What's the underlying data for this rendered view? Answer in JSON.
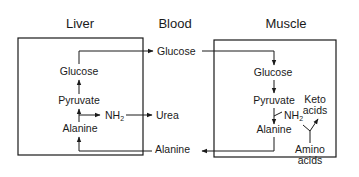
{
  "diagram": {
    "type": "glucose-alanine cycle",
    "compartments": [
      {
        "id": "liver",
        "title": "Liver"
      },
      {
        "id": "blood",
        "title": "Blood"
      },
      {
        "id": "muscle",
        "title": "Muscle"
      }
    ],
    "liver": {
      "glucose": "Glucose",
      "pyruvate": "Pyruvate",
      "alanine": "Alanine",
      "nh2": "NH",
      "nh2_sub": "2"
    },
    "blood": {
      "glucose": "Glucose",
      "urea": "Urea",
      "alanine": "Alanine"
    },
    "muscle": {
      "glucose": "Glucose",
      "pyruvate": "Pyruvate",
      "alanine": "Alanine",
      "nh2": "NH",
      "nh2_sub": "2",
      "keto1": "Keto",
      "keto2": "acids",
      "amino1": "Amino",
      "amino2": "acids"
    },
    "edges": [
      {
        "from": "Liver Alanine",
        "to": "Liver Pyruvate"
      },
      {
        "from": "Liver Pyruvate",
        "to": "Liver Glucose"
      },
      {
        "from": "Liver Glucose",
        "to": "Blood Glucose"
      },
      {
        "from": "Blood Glucose",
        "to": "Muscle Glucose"
      },
      {
        "from": "Muscle Glucose",
        "to": "Muscle Pyruvate"
      },
      {
        "from": "Muscle Pyruvate",
        "to": "Muscle Alanine"
      },
      {
        "from": "Muscle NH2",
        "to": "Muscle Alanine"
      },
      {
        "from": "Amino acids",
        "to": "Keto acids"
      },
      {
        "from": "Muscle Alanine",
        "to": "Blood Alanine"
      },
      {
        "from": "Blood Alanine",
        "to": "Liver Alanine"
      },
      {
        "from": "Liver Alanine",
        "to": "NH2"
      },
      {
        "from": "NH2",
        "to": "Urea"
      }
    ]
  }
}
